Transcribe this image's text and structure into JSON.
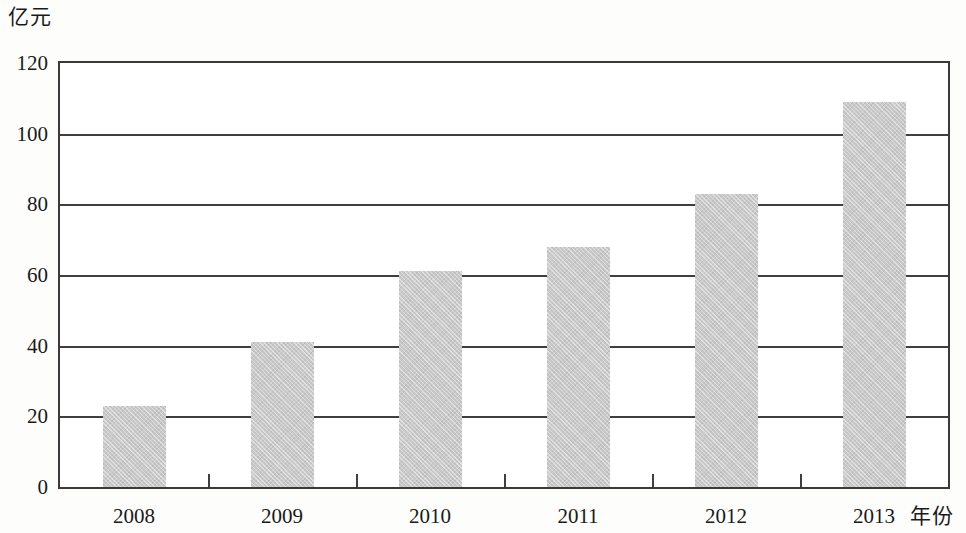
{
  "chart_data": {
    "type": "bar",
    "title": "",
    "subtitle": "",
    "xlabel": "年份",
    "ylabel": "亿元",
    "categories": [
      "2008",
      "2009",
      "2010",
      "2011",
      "2012",
      "2013"
    ],
    "values": [
      23,
      41,
      61,
      68,
      83,
      109
    ],
    "series": [
      {
        "name": "",
        "values": [
          23,
          41,
          61,
          68,
          83,
          109
        ]
      }
    ],
    "ylim": [
      0,
      120
    ],
    "yticks": [
      0,
      20,
      40,
      60,
      80,
      100,
      120
    ],
    "ytick_labels": [
      "0",
      "20",
      "40",
      "60",
      "80",
      "100",
      "120"
    ],
    "grid": "horizontal",
    "legend": "none",
    "bar_color": "#c9c9c9",
    "axis_color": "#3f3f3f",
    "background": "#ffffff"
  }
}
